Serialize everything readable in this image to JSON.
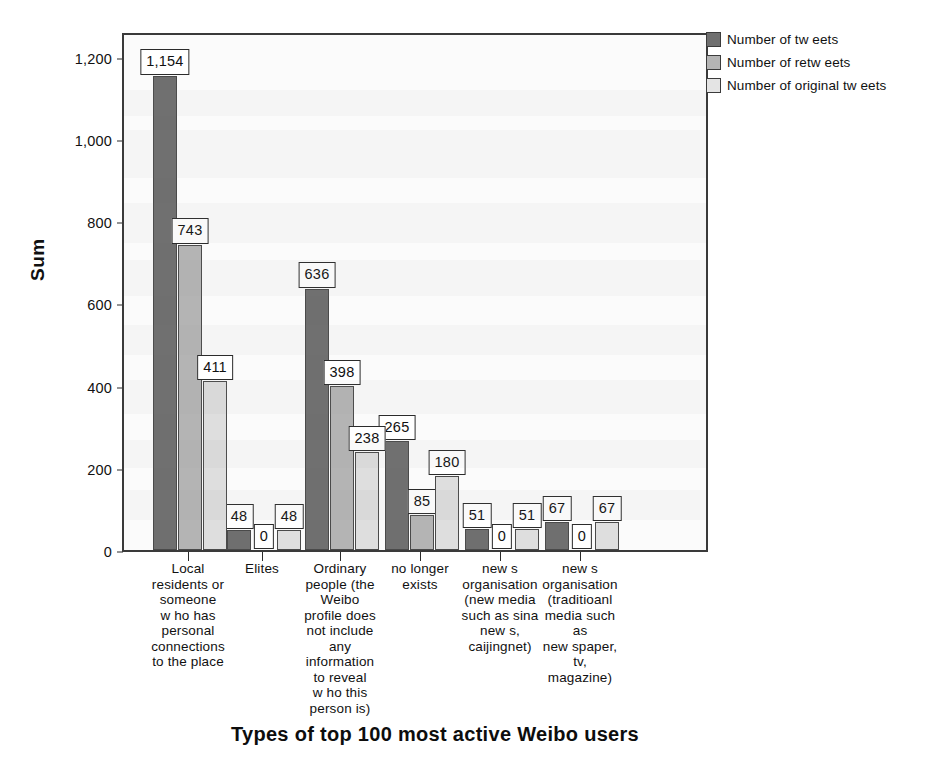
{
  "chart_data": {
    "type": "bar",
    "title": "",
    "xlabel": "Types of top 100 most active Weibo users",
    "ylabel": "Sum",
    "ylim": [
      0,
      1260
    ],
    "yticks": [
      0,
      200,
      400,
      600,
      800,
      1000,
      1200
    ],
    "ytick_labels": [
      "0",
      "200",
      "400",
      "600",
      "800",
      "1,000",
      "1,200"
    ],
    "grid": false,
    "legend_position": "top-right",
    "categories": [
      "Local residents or someone w ho has personal connections to the place",
      "Elites",
      "Ordinary people (the Weibo profile does not include any information to reveal w ho this person is)",
      "no longer exists",
      "new s organisation (new media such as sina new s, caijingnet)",
      "new s organisation (traditioanl media such as new spaper, tv, magazine)"
    ],
    "category_lines": [
      [
        "Local",
        "residents or",
        "someone",
        "w ho has",
        "personal",
        "connections",
        "to the place"
      ],
      [
        "Elites"
      ],
      [
        "Ordinary",
        "people (the",
        "Weibo",
        "profile does",
        "not include",
        "any",
        "information",
        "to reveal",
        "w ho this",
        "person is)"
      ],
      [
        "no longer",
        "exists"
      ],
      [
        "new s",
        "organisation",
        "(new media",
        "such as sina",
        "new s,",
        "caijingnet)"
      ],
      [
        "new s",
        "organisation",
        "(traditioanl",
        "media such",
        "as",
        "new spaper,",
        "tv,",
        "magazine)"
      ]
    ],
    "series": [
      {
        "name": "Number of tw eets",
        "color": "#6f6f6f",
        "values": [
          1154,
          48,
          636,
          265,
          51,
          67
        ],
        "labels": [
          "1,154",
          "48",
          "636",
          "265",
          "51",
          "67"
        ]
      },
      {
        "name": "Number of retw eets",
        "color": "#b4b4b4",
        "values": [
          743,
          0,
          398,
          85,
          0,
          0
        ],
        "labels": [
          "743",
          "0",
          "398",
          "85",
          "0",
          "0"
        ]
      },
      {
        "name": "Number of original tw eets",
        "color": "#dedede",
        "values": [
          411,
          48,
          238,
          180,
          51,
          67
        ],
        "labels": [
          "411",
          "48",
          "238",
          "180",
          "51",
          "67"
        ]
      }
    ]
  },
  "legend": {
    "items": [
      {
        "label": "Number of tw eets"
      },
      {
        "label": "Number of retw eets"
      },
      {
        "label": "Number of original tw eets"
      }
    ]
  },
  "axes": {
    "y_title": "Sum",
    "x_title": "Types of top 100 most active Weibo users"
  }
}
